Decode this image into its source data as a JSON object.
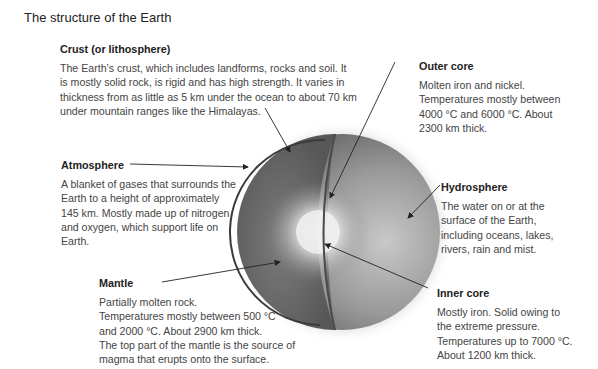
{
  "title": "The structure of the Earth",
  "layers": {
    "crust": {
      "heading": "Crust (or lithosphere)",
      "lines": [
        "The Earth’s crust, which includes landforms, rocks and soil. It",
        "is mostly solid rock, is rigid and has high strength. It varies in",
        "thickness from as little as 5 km under the ocean to about 70 km",
        "under mountain ranges like the Himalayas."
      ]
    },
    "outer_core": {
      "heading": "Outer core",
      "lines": [
        "Molten iron and nickel.",
        "Temperatures mostly between",
        "4000 °C and 6000 °C. About",
        "2300 km thick."
      ]
    },
    "atmosphere": {
      "heading": "Atmosphere",
      "lines": [
        "A blanket of gases that surrounds the",
        "Earth to a height of approximately",
        "145 km. Mostly made up of nitrogen",
        "and oxygen, which support life on",
        "Earth."
      ]
    },
    "hydrosphere": {
      "heading": "Hydrosphere",
      "lines": [
        "The water on or at the",
        "surface of the Earth,",
        "including oceans, lakes,",
        "rivers, rain and mist."
      ]
    },
    "mantle": {
      "heading": "Mantle",
      "lines": [
        "Partially molten rock.",
        "Temperatures mostly between 500 °C",
        "and 2000 °C. About 2900 km thick.",
        "The top part of the mantle is the source of",
        "magma that erupts onto the surface."
      ]
    },
    "inner_core": {
      "heading": "Inner core",
      "lines": [
        "Mostly iron. Solid owing to",
        "the extreme pressure.",
        "Temperatures up to 7000 °C.",
        "About 1200 km thick."
      ]
    }
  }
}
